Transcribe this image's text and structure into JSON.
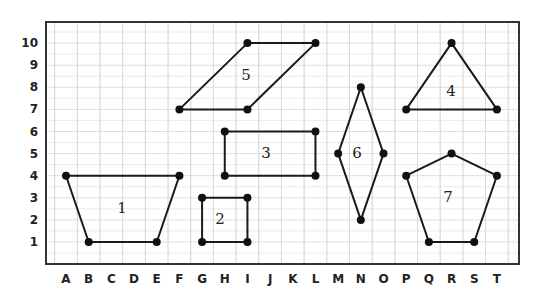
{
  "diagram": {
    "type": "coordinate-grid-shapes",
    "x_axis": {
      "labels": [
        "A",
        "B",
        "C",
        "D",
        "E",
        "F",
        "G",
        "H",
        "I",
        "J",
        "K",
        "L",
        "M",
        "N",
        "O",
        "P",
        "Q",
        "R",
        "S",
        "T"
      ]
    },
    "y_axis": {
      "labels": [
        "1",
        "2",
        "3",
        "4",
        "5",
        "6",
        "7",
        "8",
        "9",
        "10"
      ]
    },
    "colors": {
      "grid": "#d6d6d6",
      "border": "#333333",
      "shape_stroke": "#1a1a1a",
      "vertex": "#111111",
      "text": "#222222"
    },
    "shapes": [
      {
        "id": "1",
        "label": "1",
        "kind": "trapezoid",
        "vertices": [
          "A4",
          "F4",
          "E1",
          "B1"
        ],
        "label_at": [
          "C+0.5",
          "2.5"
        ]
      },
      {
        "id": "2",
        "label": "2",
        "kind": "square",
        "vertices": [
          "G3",
          "I3",
          "I1",
          "G1"
        ],
        "label_at": [
          "H",
          "2"
        ]
      },
      {
        "id": "3",
        "label": "3",
        "kind": "rectangle",
        "vertices": [
          "H6",
          "L6",
          "L4",
          "H4"
        ],
        "label_at": [
          "J",
          "5"
        ]
      },
      {
        "id": "4",
        "label": "4",
        "kind": "triangle",
        "vertices": [
          "R10",
          "T7",
          "P7"
        ],
        "label_at": [
          "R",
          "8"
        ]
      },
      {
        "id": "5",
        "label": "5",
        "kind": "parallelogram",
        "vertices": [
          "F7",
          "I10",
          "L10",
          "I7"
        ],
        "label_at": [
          "I",
          "8.5"
        ]
      },
      {
        "id": "6",
        "label": "6",
        "kind": "rhombus",
        "vertices": [
          "N8",
          "O5",
          "N2",
          "M5"
        ],
        "label_at": [
          "N",
          "5"
        ]
      },
      {
        "id": "7",
        "label": "7",
        "kind": "pentagon",
        "vertices": [
          "R5",
          "T4",
          "S1",
          "Q1",
          "P4"
        ],
        "label_at": [
          "R",
          "3"
        ]
      }
    ]
  }
}
